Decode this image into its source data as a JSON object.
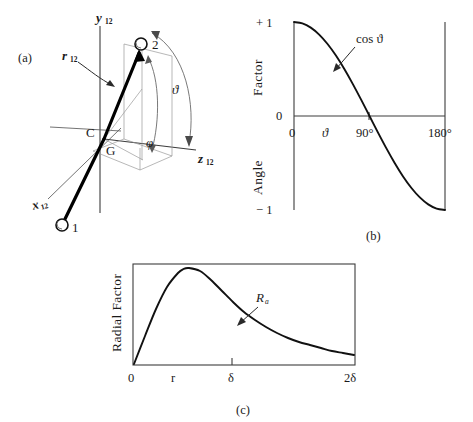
{
  "figure": {
    "background_color": "#ffffff",
    "ink_color": "#1a1a1a",
    "curve_color": "#111111"
  },
  "panel_a": {
    "tag": "(a)",
    "axis_y_label": "y",
    "axis_y_sub": "12",
    "axis_z_label": "z",
    "axis_z_sub": "12",
    "axis_x_label": "x",
    "axis_x_sub": "12",
    "vector_label": "r",
    "vector_sub": "12",
    "point_c_label": "C",
    "point_g_label": "G",
    "atom_1_label": "1",
    "atom_2_label": "2",
    "angle_theta_label": "ϑ",
    "angle_phi_label": "φ"
  },
  "panel_b": {
    "tag": "(b)",
    "y_axis_title_upper": "Factor",
    "y_axis_title_lower": "Angle",
    "y_tick_top": "+ 1",
    "y_tick_mid": "0",
    "y_tick_bottom": "− 1",
    "x_tick_0": "0",
    "x_tick_90": "90°",
    "x_tick_180": "180°",
    "x_var_label": "ϑ",
    "curve_label": "cos ϑ",
    "chart_data": {
      "type": "line",
      "title": "",
      "xlabel": "Angle",
      "ylabel": "Angle Factor",
      "xlim": [
        0,
        180
      ],
      "ylim": [
        -1,
        1
      ],
      "xticks": [
        0,
        90,
        180
      ],
      "xticklabels": [
        "0",
        "90°",
        "180°"
      ],
      "yticks": [
        -1,
        0,
        1
      ],
      "yticklabels": [
        "− 1",
        "0",
        "+ 1"
      ],
      "grid": false,
      "legend": "none",
      "annotations": [
        {
          "text": "cos ϑ",
          "x": 68,
          "y": 0.6
        }
      ],
      "series": [
        {
          "name": "cos ϑ",
          "x": [
            0,
            10,
            20,
            30,
            40,
            50,
            60,
            70,
            80,
            90,
            100,
            110,
            120,
            130,
            140,
            150,
            160,
            170,
            180
          ],
          "values": [
            1.0,
            0.985,
            0.94,
            0.866,
            0.766,
            0.643,
            0.5,
            0.342,
            0.174,
            0.0,
            -0.174,
            -0.342,
            -0.5,
            -0.643,
            -0.766,
            -0.866,
            -0.94,
            -0.985,
            -1.0
          ]
        }
      ]
    }
  },
  "panel_c": {
    "tag": "(c)",
    "y_axis_title": "Radial Factor",
    "x_tick_0": "0",
    "x_tick_r": "r",
    "x_tick_delta": "δ",
    "x_tick_2delta": "2δ",
    "curve_label": "R",
    "curve_label_sub": "a",
    "chart_data": {
      "type": "line",
      "title": "",
      "xlabel": "",
      "ylabel": "Radial Factor",
      "xlim": [
        0,
        2
      ],
      "ylim": [
        0,
        1
      ],
      "xticks": [
        0,
        0.42,
        0.9,
        2
      ],
      "xticklabels": [
        "0",
        "r",
        "δ",
        "2δ"
      ],
      "yticks": [],
      "yticklabels": [],
      "grid": false,
      "legend": "none",
      "annotations": [
        {
          "text": "R",
          "subscript": "a",
          "x": 1.05,
          "y": 0.72
        }
      ],
      "series": [
        {
          "name": "R_a",
          "x": [
            0.0,
            0.1,
            0.2,
            0.3,
            0.4,
            0.45,
            0.5,
            0.6,
            0.7,
            0.8,
            0.9,
            1.0,
            1.1,
            1.2,
            1.3,
            1.4,
            1.5,
            1.6,
            1.7,
            1.8,
            1.9,
            2.0
          ],
          "values": [
            0.0,
            0.28,
            0.55,
            0.77,
            0.91,
            0.95,
            0.96,
            0.93,
            0.84,
            0.73,
            0.62,
            0.52,
            0.44,
            0.37,
            0.31,
            0.26,
            0.22,
            0.19,
            0.16,
            0.13,
            0.11,
            0.09
          ]
        }
      ]
    }
  }
}
